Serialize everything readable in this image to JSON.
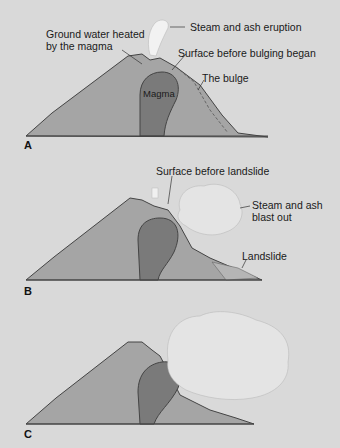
{
  "panels": [
    {
      "id": "A",
      "label": "A",
      "annotations": {
        "steam": "Steam and ash eruption",
        "groundwater_1": "Ground water heated",
        "groundwater_2": "by the magma",
        "surface": "Surface before bulging began",
        "bulge": "The bulge",
        "magma": "Magma"
      }
    },
    {
      "id": "B",
      "label": "B",
      "annotations": {
        "surface": "Surface before landslide",
        "blast_1": "Steam and ash",
        "blast_2": "blast out",
        "landslide": "Landslide"
      }
    },
    {
      "id": "C",
      "label": "C",
      "annotations": {}
    }
  ],
  "colors": {
    "background": "#d9d9d9",
    "mountain": "#a5a5a5",
    "magma": "#7a7a7a",
    "outline": "#444444",
    "cloud": "#e6e6e6"
  }
}
